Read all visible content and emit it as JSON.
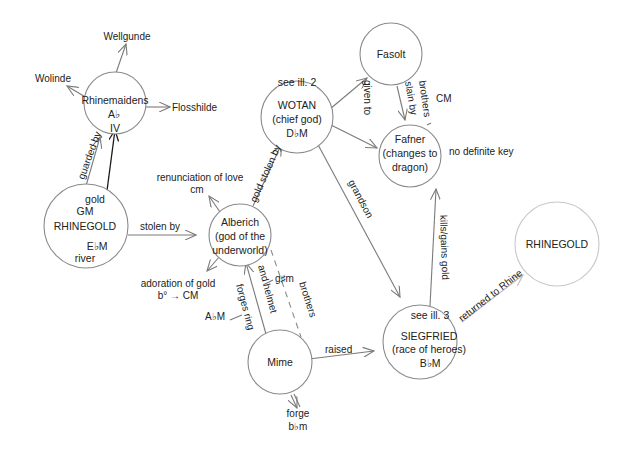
{
  "nodes": {
    "rhinemaidens": {
      "label": "Rhinemaidens",
      "key": "A♭",
      "numeral": "IV"
    },
    "rhinegold_left": {
      "label": "RHINEGOLD",
      "gold": "gold",
      "gm": "GM",
      "key": "E♭M",
      "river": "river"
    },
    "alberich": {
      "line1": "Alberich",
      "line2": "(god of the",
      "line3": "underworld)"
    },
    "wotan": {
      "note": "see ill. 2",
      "line1": "WOTAN",
      "line2": "(chief god)",
      "key": "D♭M"
    },
    "fasolt": {
      "label": "Fasolt"
    },
    "fafner": {
      "line1": "Fafner",
      "line2": "(changes to",
      "line3": "dragon)"
    },
    "mime": {
      "label": "Mime"
    },
    "siegfried": {
      "note": "see ill. 3",
      "line1": "SIEGFRIED",
      "line2": "(race of heroes)",
      "key": "B♭M"
    },
    "rhinegold_right": {
      "label": "RHINEGOLD"
    }
  },
  "outer_labels": {
    "wellgunde": "Wellgunde",
    "wolinde": "Wolinde",
    "flosshilde": "Flosshilde",
    "renunciation": "renunciation of love",
    "renunciation_key": "cm",
    "adoration": "adoration of gold",
    "adoration_key": "b° → CM",
    "forges_key": "A♭M",
    "helmet_key": "g♯m",
    "forge": "forge",
    "forge_key": "b♭m",
    "fafner_key": "no definite key",
    "brothers_key": "CM"
  },
  "edges": {
    "guarded_by": "guarded by",
    "stolen_by": "stolen by",
    "gold_stolen_by": "gold stolen by",
    "given_to": "given to",
    "slain_by": "slain by",
    "brothers_top": "brothers",
    "grandson": "grandson",
    "kills_gains_gold": "kills/gains gold",
    "returned_to_rhine": "returned to Rhine",
    "raised": "raised",
    "forges_ring": "forges ring",
    "and_helmet": "and helmet",
    "brothers_bottom": "brothers"
  }
}
